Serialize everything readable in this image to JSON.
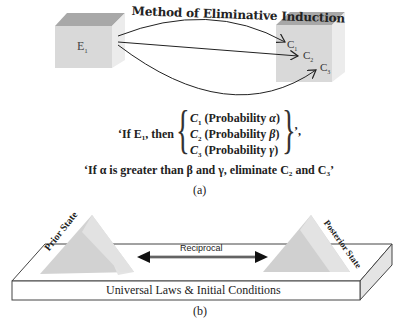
{
  "panel_a": {
    "title": "Method of Eliminative Induction",
    "left_box_label": "E",
    "left_box_sub": "1",
    "right_box_labels": [
      {
        "label": "C",
        "sub": "1"
      },
      {
        "label": "C",
        "sub": "2"
      },
      {
        "label": "C",
        "sub": "3"
      }
    ],
    "rule_prefix": "‘If E₁, then",
    "conditions": [
      {
        "c": "C",
        "sub": "1",
        "text": " (Probability ",
        "greek": "α",
        "close": ")"
      },
      {
        "c": "C",
        "sub": "2",
        "text": " (Probability ",
        "greek": "β",
        "close": ")"
      },
      {
        "c": "C",
        "sub": "3",
        "text": " (Probability ",
        "greek": "γ",
        "close": ")"
      }
    ],
    "rule_suffix": "’,",
    "elimination": "‘If α is greater than β and γ, eliminate C₂ and C₃’",
    "caption": "(a)"
  },
  "panel_b": {
    "prior_label": "Prior State",
    "posterior_label": "Posterior State",
    "arrow_label": "Reciprocal",
    "base_label": "Universal Laws & Initial Conditions",
    "caption": "(b)"
  },
  "colors": {
    "box_front": "#d9d9d9",
    "box_top": "#a8a8a8",
    "box_side": "#e6e6e6",
    "pyramid_light": "#e0e0e0",
    "pyramid_dark": "#cfcfcf"
  }
}
